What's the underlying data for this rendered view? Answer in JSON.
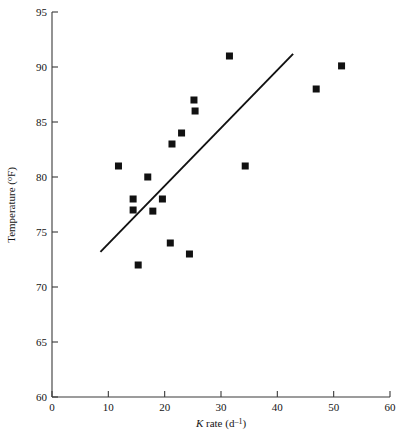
{
  "chart_data": {
    "type": "scatter",
    "title": "",
    "xlabel": "K rate (d⁻¹)",
    "ylabel": "Temperature (°F)",
    "xlim": [
      0,
      60
    ],
    "ylim": [
      60,
      95
    ],
    "xticks": [
      0,
      10,
      20,
      30,
      40,
      50,
      60
    ],
    "yticks": [
      60,
      65,
      70,
      75,
      80,
      85,
      90,
      95
    ],
    "xtick_labels": [
      "0",
      "10",
      "20",
      "30",
      "40",
      "50",
      "60"
    ],
    "ytick_labels": [
      "60",
      "65",
      "70",
      "75",
      "80",
      "85",
      "90",
      "95"
    ],
    "grid": false,
    "legend": null,
    "marker_style": "filled-square",
    "marker_color": "#111111",
    "points": [
      {
        "x": 11.8,
        "y": 81.0
      },
      {
        "x": 14.4,
        "y": 78.0
      },
      {
        "x": 14.4,
        "y": 77.0
      },
      {
        "x": 15.3,
        "y": 72.0
      },
      {
        "x": 17.0,
        "y": 80.0
      },
      {
        "x": 17.9,
        "y": 76.9
      },
      {
        "x": 19.6,
        "y": 78.0
      },
      {
        "x": 21.0,
        "y": 74.0
      },
      {
        "x": 21.3,
        "y": 83.0
      },
      {
        "x": 23.0,
        "y": 84.0
      },
      {
        "x": 24.4,
        "y": 73.0
      },
      {
        "x": 25.2,
        "y": 87.0
      },
      {
        "x": 25.4,
        "y": 86.0
      },
      {
        "x": 31.5,
        "y": 91.0
      },
      {
        "x": 34.3,
        "y": 81.0
      },
      {
        "x": 46.9,
        "y": 88.0
      },
      {
        "x": 51.4,
        "y": 90.1
      }
    ],
    "trend_line": {
      "type": "linear-fit",
      "x_start": 8.6,
      "y_start": 73.2,
      "x_end": 42.8,
      "y_end": 91.2,
      "color": "#111111"
    }
  }
}
